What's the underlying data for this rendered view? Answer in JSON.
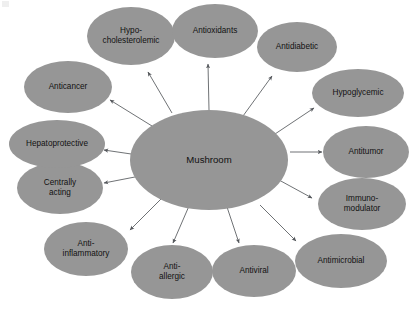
{
  "diagram": {
    "center": {
      "id": "mushroom",
      "label": "Mushroom",
      "cx": 209,
      "cy": 160,
      "rx": 79,
      "ry": 50,
      "color": "#969696"
    },
    "node_color": "#969696",
    "label_color": "#111111",
    "edge_color": "#55585c",
    "background": "#ffffff",
    "nodes": [
      {
        "id": "hypocholesterolemic",
        "label_lines": [
          "Hypo-",
          "cholesterolemic"
        ],
        "cx": 131,
        "cy": 36,
        "rx": 44,
        "ry": 29,
        "arrow_tip": {
          "x": 148,
          "y": 72
        },
        "arrow_tail": {
          "x": 172,
          "y": 113
        }
      },
      {
        "id": "antioxidants",
        "label_lines": [
          "Antioxidants"
        ],
        "cx": 215,
        "cy": 31,
        "rx": 43,
        "ry": 27,
        "arrow_tip": {
          "x": 208,
          "y": 64
        },
        "arrow_tail": {
          "x": 209,
          "y": 110
        }
      },
      {
        "id": "antidiabetic",
        "label_lines": [
          "Antidiabetic"
        ],
        "cx": 297,
        "cy": 47,
        "rx": 40,
        "ry": 25,
        "arrow_tip": {
          "x": 272,
          "y": 76
        },
        "arrow_tail": {
          "x": 243,
          "y": 116
        }
      },
      {
        "id": "hypoglycemic",
        "label_lines": [
          "Hypoglycemic"
        ],
        "cx": 358,
        "cy": 93,
        "rx": 46,
        "ry": 24,
        "arrow_tip": {
          "x": 314,
          "y": 108
        },
        "arrow_tail": {
          "x": 275,
          "y": 134
        }
      },
      {
        "id": "antitumor",
        "label_lines": [
          "Antitumor"
        ],
        "cx": 366,
        "cy": 152,
        "rx": 43,
        "ry": 26,
        "arrow_tip": {
          "x": 322,
          "y": 152
        },
        "arrow_tail": {
          "x": 290,
          "y": 152
        }
      },
      {
        "id": "immunomodulator",
        "label_lines": [
          "Immuno-",
          "modulator"
        ],
        "cx": 362,
        "cy": 204,
        "rx": 44,
        "ry": 26,
        "arrow_tip": {
          "x": 312,
          "y": 198
        },
        "arrow_tail": {
          "x": 279,
          "y": 180
        }
      },
      {
        "id": "antimicrobial",
        "label_lines": [
          "Antimicrobial"
        ],
        "cx": 341,
        "cy": 261,
        "rx": 46,
        "ry": 27,
        "arrow_tip": {
          "x": 296,
          "y": 241
        },
        "arrow_tail": {
          "x": 260,
          "y": 205
        }
      },
      {
        "id": "antiviral",
        "label_lines": [
          "Antiviral"
        ],
        "cx": 254,
        "cy": 271,
        "rx": 42,
        "ry": 26,
        "arrow_tip": {
          "x": 239,
          "y": 243
        },
        "arrow_tail": {
          "x": 227,
          "y": 207
        }
      },
      {
        "id": "antiallergic",
        "label_lines": [
          "Anti-",
          "allergic"
        ],
        "cx": 172,
        "cy": 272,
        "rx": 41,
        "ry": 27,
        "arrow_tip": {
          "x": 173,
          "y": 243
        },
        "arrow_tail": {
          "x": 189,
          "y": 206
        }
      },
      {
        "id": "antiinflammatory",
        "label_lines": [
          "Anti-",
          "inflammatory"
        ],
        "cx": 86,
        "cy": 249,
        "rx": 42,
        "ry": 27,
        "arrow_tip": {
          "x": 130,
          "y": 230
        },
        "arrow_tail": {
          "x": 161,
          "y": 199
        }
      },
      {
        "id": "centrally-acting",
        "label_lines": [
          "Centrally",
          "acting"
        ],
        "cx": 60,
        "cy": 188,
        "rx": 43,
        "ry": 26,
        "arrow_tip": {
          "x": 104,
          "y": 183
        },
        "arrow_tail": {
          "x": 140,
          "y": 176
        }
      },
      {
        "id": "hepatoprotective",
        "label_lines": [
          "Hepatoprotective"
        ],
        "cx": 57,
        "cy": 144,
        "rx": 48,
        "ry": 24,
        "arrow_tip": {
          "x": 104,
          "y": 150
        },
        "arrow_tail": {
          "x": 138,
          "y": 155
        }
      },
      {
        "id": "anticancer",
        "label_lines": [
          "Anticancer"
        ],
        "cx": 68,
        "cy": 87,
        "rx": 44,
        "ry": 26,
        "arrow_tip": {
          "x": 110,
          "y": 100
        },
        "arrow_tail": {
          "x": 152,
          "y": 126
        }
      }
    ]
  }
}
